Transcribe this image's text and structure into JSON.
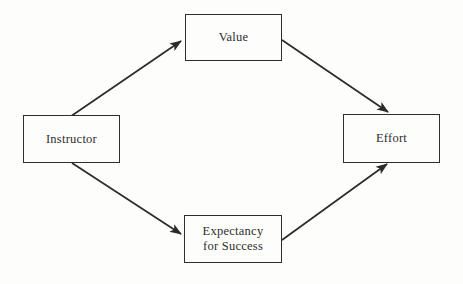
{
  "colors": {
    "background": "#fdfdfc",
    "line": "#2b2b2b",
    "box_border": "#2e2e2e",
    "text": "#2d2d2d"
  },
  "nodes": {
    "instructor": {
      "label": "Instructor"
    },
    "value": {
      "label": "Value"
    },
    "effort": {
      "label": "Effort"
    },
    "expectancy": {
      "label_line1": "Expectancy",
      "label_line2": "for Success"
    }
  },
  "edges": [
    {
      "from": "Instructor",
      "to": "Value"
    },
    {
      "from": "Instructor",
      "to": "Expectancy for Success"
    },
    {
      "from": "Value",
      "to": "Effort"
    },
    {
      "from": "Expectancy for Success",
      "to": "Effort"
    }
  ]
}
